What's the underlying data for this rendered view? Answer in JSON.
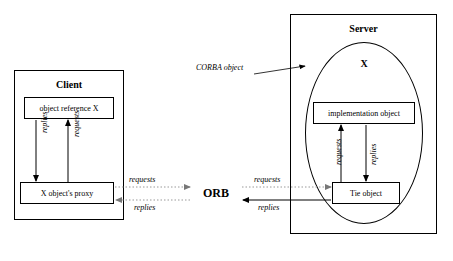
{
  "diagram": {
    "nodes": {
      "client_container": {
        "label": "Client"
      },
      "server_container": {
        "label": "Server"
      },
      "object_reference": {
        "label": "object reference X"
      },
      "object_proxy": {
        "label": "X object's proxy"
      },
      "corba_object": {
        "label": "X"
      },
      "implementation_object": {
        "label": "implementation object"
      },
      "tie_object": {
        "label": "Tie object"
      },
      "orb": {
        "label": "ORB"
      },
      "corba_object_annotation": {
        "label": "CORBA object"
      }
    },
    "edges": [
      {
        "name": "proxy-to-reference-requests",
        "label": "requests"
      },
      {
        "name": "reference-to-proxy-replies",
        "label": "replies"
      },
      {
        "name": "proxy-to-orb-requests",
        "label": "requests"
      },
      {
        "name": "orb-to-proxy-replies",
        "label": "replies"
      },
      {
        "name": "orb-to-tie-requests",
        "label": "requests"
      },
      {
        "name": "tie-to-orb-replies",
        "label": "replies"
      },
      {
        "name": "tie-to-implementation-requests",
        "label": "requests"
      },
      {
        "name": "implementation-to-tie-replies",
        "label": "replies"
      }
    ],
    "colors": {
      "stroke": "#000000",
      "background": "#ffffff",
      "dotted_stroke": "#999999"
    }
  }
}
